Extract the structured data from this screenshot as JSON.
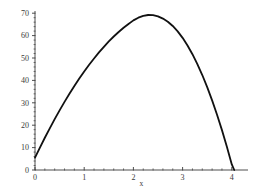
{
  "chart_data": {
    "type": "line",
    "title": "",
    "xlabel": "x",
    "ylabel": "",
    "xlim": [
      0,
      4.08
    ],
    "ylim": [
      0,
      73
    ],
    "grid": false,
    "legend": null,
    "xticks": [
      0,
      1,
      2,
      3,
      4
    ],
    "xticklabels": [
      "0",
      "1",
      "2",
      "3",
      "4"
    ],
    "yticks": [
      0,
      10,
      20,
      30,
      40,
      50,
      60,
      70
    ],
    "yticklabels": [
      "0",
      "10",
      "20",
      "30",
      "40",
      "50",
      "60",
      "70"
    ],
    "x_minor_tick_count": 5,
    "y_minor_tick_count": 5,
    "series": [
      {
        "name": "curve",
        "color": "#111111",
        "linewidth": 1.8,
        "x": [
          0.0,
          0.1,
          0.2,
          0.3,
          0.4,
          0.5,
          0.6,
          0.7,
          0.8,
          0.9,
          1.0,
          1.1,
          1.2,
          1.3,
          1.4,
          1.5,
          1.6,
          1.7,
          1.8,
          1.9,
          2.0,
          2.1,
          2.2,
          2.3,
          2.4,
          2.5,
          2.6,
          2.7,
          2.8,
          2.9,
          3.0,
          3.1,
          3.2,
          3.3,
          3.4,
          3.5,
          3.6,
          3.7,
          3.8,
          3.9,
          4.0,
          4.05
        ],
        "y": [
          5.5,
          10.0,
          14.4,
          18.6,
          22.7,
          26.6,
          30.4,
          34.0,
          37.5,
          40.8,
          44.0,
          47.0,
          49.8,
          52.5,
          55.0,
          57.4,
          59.6,
          61.6,
          63.5,
          65.2,
          66.8,
          68.0,
          68.8,
          69.2,
          69.1,
          68.6,
          67.6,
          66.2,
          64.3,
          61.9,
          59.0,
          55.6,
          51.7,
          47.3,
          42.4,
          37.0,
          31.1,
          24.7,
          17.8,
          10.4,
          2.5,
          0.0
        ]
      }
    ],
    "axes_color": "#3a3a3a",
    "background_color": "#ffffff"
  },
  "figure": {
    "plot_area": {
      "x_origin_px": 35,
      "y_origin_px": 170,
      "px_per_x_unit": 49.2,
      "px_per_y_unit": 2.24
    }
  }
}
